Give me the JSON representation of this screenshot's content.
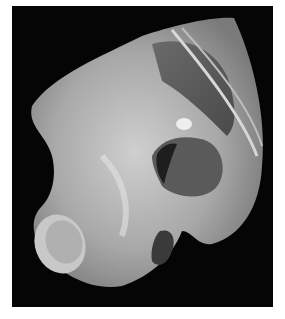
{
  "image": {
    "subject": "grayscale photograph of dissected anatomical specimen on black background",
    "background_color": "#ffffff",
    "frame_color": "#050505"
  }
}
